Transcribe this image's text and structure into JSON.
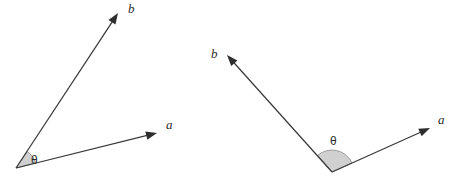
{
  "figure": {
    "name": "angle-between-vectors",
    "background_color": "#ffffff",
    "line_color": "#3a3a3a",
    "wedge_fill_color": "#d0d0d0",
    "wedge_stroke_color": "#8c8c8c",
    "label_color": "#2b2b2b"
  },
  "panels": [
    {
      "id": "left",
      "name": "acute-angle-panel",
      "vertex": {
        "x": 16,
        "y": 168
      },
      "vectors": [
        {
          "id": "a",
          "label": "a",
          "tip": {
            "x": 157,
            "y": 133
          },
          "label_pos": {
            "x": 166,
            "y": 129
          }
        },
        {
          "id": "b",
          "label": "b",
          "tip": {
            "x": 118,
            "y": 13
          },
          "label_pos": {
            "x": 128,
            "y": 13
          }
        }
      ],
      "angle": {
        "label": "θ",
        "label_pos": {
          "x": 31,
          "y": 164
        },
        "radius": 20,
        "start_deg": 14,
        "end_deg": 55,
        "measure_deg": 41
      }
    },
    {
      "id": "right",
      "name": "obtuse-angle-panel",
      "vertex": {
        "x": 332,
        "y": 172
      },
      "vectors": [
        {
          "id": "a",
          "label": "a",
          "tip": {
            "x": 430,
            "y": 128
          },
          "label_pos": {
            "x": 438,
            "y": 124
          }
        },
        {
          "id": "b",
          "label": "b",
          "tip": {
            "x": 227,
            "y": 55
          },
          "label_pos": {
            "x": 211,
            "y": 58
          }
        }
      ],
      "angle": {
        "label": "θ",
        "label_pos": {
          "x": 330,
          "y": 145
        },
        "radius": 22,
        "start_deg": 24,
        "end_deg": 131,
        "measure_deg": 107
      }
    }
  ]
}
